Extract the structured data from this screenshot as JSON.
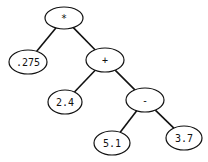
{
  "diagram": {
    "type": "expression-tree",
    "nodes": [
      {
        "id": "n0",
        "label": "*",
        "cx": 64,
        "cy": 18,
        "rx": 19,
        "ry": 11,
        "kind": "operator"
      },
      {
        "id": "n1",
        "label": ".275",
        "cx": 28,
        "cy": 62,
        "rx": 19,
        "ry": 12,
        "kind": "operand"
      },
      {
        "id": "n2",
        "label": "+",
        "cx": 105,
        "cy": 60,
        "rx": 19,
        "ry": 12,
        "kind": "operator"
      },
      {
        "id": "n3",
        "label": "2.4",
        "cx": 65,
        "cy": 102,
        "rx": 17,
        "ry": 12,
        "kind": "operand"
      },
      {
        "id": "n4",
        "label": "-",
        "cx": 145,
        "cy": 100,
        "rx": 19,
        "ry": 12,
        "kind": "operator"
      },
      {
        "id": "n5",
        "label": "5.1",
        "cx": 112,
        "cy": 143,
        "rx": 18,
        "ry": 12,
        "kind": "operand"
      },
      {
        "id": "n6",
        "label": "3.7",
        "cx": 184,
        "cy": 138,
        "rx": 18,
        "ry": 12,
        "kind": "operand"
      }
    ],
    "edges": [
      {
        "from": "n0",
        "to": "n1"
      },
      {
        "from": "n0",
        "to": "n2"
      },
      {
        "from": "n2",
        "to": "n3"
      },
      {
        "from": "n2",
        "to": "n4"
      },
      {
        "from": "n4",
        "to": "n5"
      },
      {
        "from": "n4",
        "to": "n6"
      }
    ],
    "colors": {
      "stroke": "#111111",
      "fill": "#ffffff",
      "text": "#111111"
    }
  }
}
